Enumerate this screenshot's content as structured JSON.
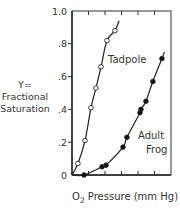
{
  "chart_data": {
    "type": "scatter",
    "title": "",
    "xlabel_prefix": "O",
    "xlabel_sub": "2",
    "xlabel_rest": " Pressure (mm Hg)",
    "xlabel": "O2 Pressure (mm Hg)",
    "ylabel_lines": [
      "Y=",
      "Fractional",
      "Saturation"
    ],
    "ylabel": "Y= Fractional Saturation",
    "ylim": [
      0,
      1.0
    ],
    "xlim": [
      0,
      6
    ],
    "x_units_note": "x ticks unlabeled; x in tick-interval units",
    "y_ticks": [
      {
        "value": 0,
        "label": "0"
      },
      {
        "value": 0.2,
        "label": ".2"
      },
      {
        "value": 0.4,
        "label": ".4"
      },
      {
        "value": 0.6,
        "label": ".6"
      },
      {
        "value": 0.8,
        "label": ".8"
      },
      {
        "value": 1.0,
        "label": "1.0"
      }
    ],
    "x_ticks": [
      1,
      2,
      3,
      4,
      5
    ],
    "grid": false,
    "series": [
      {
        "name": "Tadpole",
        "marker": "open-circle",
        "label": "Tadpole",
        "points": [
          {
            "x": 0.36,
            "y": 0.07
          },
          {
            "x": 0.79,
            "y": 0.21
          },
          {
            "x": 1.15,
            "y": 0.41
          },
          {
            "x": 1.45,
            "y": 0.53
          },
          {
            "x": 1.76,
            "y": 0.66
          },
          {
            "x": 2.12,
            "y": 0.82
          },
          {
            "x": 2.6,
            "y": 0.88
          }
        ]
      },
      {
        "name": "Adult Frog",
        "marker": "filled-circle",
        "label_lines": [
          "Adult",
          "Frog"
        ],
        "points": [
          {
            "x": 0.73,
            "y": 0.0
          },
          {
            "x": 1.82,
            "y": 0.05
          },
          {
            "x": 2.06,
            "y": 0.06
          },
          {
            "x": 3.09,
            "y": 0.17
          },
          {
            "x": 3.33,
            "y": 0.23
          },
          {
            "x": 4.12,
            "y": 0.38
          },
          {
            "x": 4.18,
            "y": 0.4
          },
          {
            "x": 4.48,
            "y": 0.45
          },
          {
            "x": 4.9,
            "y": 0.57
          },
          {
            "x": 5.45,
            "y": 0.71
          }
        ]
      }
    ]
  }
}
